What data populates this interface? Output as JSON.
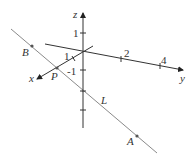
{
  "diagram": {
    "type": "3d-coordinate-axes-with-line",
    "axes": {
      "x": {
        "label": "x",
        "ticks": [
          {
            "value": "1"
          }
        ]
      },
      "y": {
        "label": "y",
        "ticks": [
          {
            "value": "2"
          },
          {
            "value": "4"
          }
        ]
      },
      "z": {
        "label": "z",
        "ticks": [
          {
            "value": "1"
          },
          {
            "value": "-1"
          }
        ]
      }
    },
    "line": {
      "label": "L"
    },
    "points": [
      {
        "label": "B"
      },
      {
        "label": "P"
      },
      {
        "label": "A"
      }
    ],
    "colors": {
      "axis": "#333333",
      "line": "#888888",
      "point": "#555555"
    }
  }
}
